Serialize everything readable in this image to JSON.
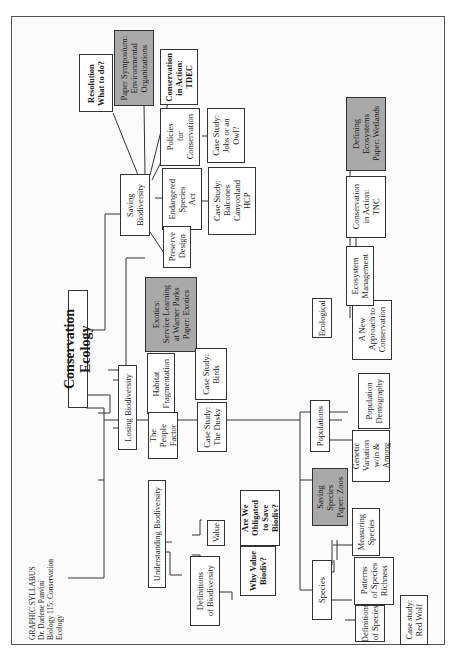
{
  "header": {
    "line1": "GRAPHIC SYLLABUS",
    "line2": "Dr. Darlene Panvini",
    "line3": "Biology 115:  Conservation Ecology"
  },
  "root": "Conservation Ecology",
  "branches": {
    "saving": {
      "label": "Saving\nBiodiversity",
      "children": {
        "resolution": "Resolution\nWhat to do?",
        "symposium": "Paper Symposium:\nEnvironmental\nOrganizations",
        "tdec": "Conservation\nin Action:\nTDEC",
        "policies": "Policies\nfor\nConservation",
        "jobs_owl": "Case Study:\nJobs or an\nOwl?",
        "esa": "Endangered\nSpecies\nAct",
        "balcones": "Case Study:\nBalcones\nCanyonland\nHCP",
        "preserve": "Preserve\nDesign"
      }
    },
    "losing": {
      "label": "Losing Biodiversity",
      "children": {
        "exotics": "Exotics:\nService Learning\nat Warner Parks\nPaper:  Exotics",
        "habitat": "Habitat\nFragmentation",
        "birds": "Case Study:\nBirds",
        "people": "The\nPeople\nFactor",
        "dusky": "Case Study:\nThe Dusky"
      }
    },
    "understanding": {
      "label": "Understanding Biodiversity",
      "children": {
        "value": "Value",
        "obligated": "Are We\nObligated\nto Save\nBiodiv?",
        "why_value": "Why Value\nBiodiv?",
        "definitions": "Definitions\nof  Biodiversity"
      }
    },
    "species": {
      "label": "Species",
      "children": {
        "saving_species": "Saving\nSpecies\nPaper:  Zoos",
        "measuring": "Measuring\nSpecies",
        "patterns": "Patterns\nof Species\nRichness",
        "definitions": "Definitions\nof Species",
        "red_wolf": "Case study:\nRed Wolf"
      }
    },
    "populations": {
      "label": "Populations",
      "children": {
        "demography": "Population\nDemography",
        "genetic": "Genetic\nVariation\nw/in &\nAmong"
      }
    },
    "ecological": {
      "label": "Ecological",
      "children": {
        "new_approach": "A New\nApproach to\nConservation",
        "management": "Ecosystem\nManagement",
        "tnc": "Conservation\nin Action:\nTNC",
        "wetlands": "Defining\nEcosystems\nPaper:  Wetlands"
      }
    }
  },
  "colors": {
    "shaded_box": "#a9a9a9",
    "line": "#333333",
    "background": "#ffffff"
  }
}
